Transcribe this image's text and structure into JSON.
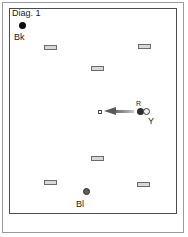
{
  "figure": {
    "caption": "Diag. 1",
    "width": 188,
    "height": 237,
    "background": "#ffffff",
    "frame_color": "#9a9a9a",
    "field_border_color": "#4c4c4c"
  },
  "tokens": [
    {
      "id": "bk",
      "label": "Bk",
      "meaning": "black",
      "color": "#0d0d0d",
      "shape": "circle",
      "x": 19,
      "y": 22,
      "diameter": 7,
      "label_x": 14,
      "label_y": 33
    },
    {
      "id": "r",
      "label": "R",
      "meaning": "red",
      "color": "#2e2e2e",
      "shape": "circle",
      "x": 137,
      "y": 108,
      "diameter": 7,
      "label_x": 136,
      "label_y": 100
    },
    {
      "id": "y",
      "label": "Y",
      "meaning": "yellow",
      "color": "#f2f2f2",
      "shape": "circle",
      "x": 143,
      "y": 108,
      "diameter": 7,
      "label_x": 147,
      "label_y": 117
    },
    {
      "id": "bl",
      "label": "Bl",
      "meaning": "blue",
      "color": "#5e5e5e",
      "shape": "circle",
      "x": 83,
      "y": 188,
      "diameter": 7,
      "label_x": 76,
      "label_y": 200
    }
  ],
  "markers": [
    {
      "id": "marker-top-left",
      "x": 44,
      "y": 45,
      "width": 13,
      "height": 5
    },
    {
      "id": "marker-top-right",
      "x": 138,
      "y": 44,
      "width": 13,
      "height": 5
    },
    {
      "id": "marker-upper-center",
      "x": 91,
      "y": 66,
      "width": 13,
      "height": 5
    },
    {
      "id": "marker-lower-center",
      "x": 91,
      "y": 156,
      "width": 13,
      "height": 5
    },
    {
      "id": "marker-bottom-left",
      "x": 44,
      "y": 180,
      "width": 13,
      "height": 5
    },
    {
      "id": "marker-bottom-right",
      "x": 137,
      "y": 182,
      "width": 13,
      "height": 5
    }
  ],
  "target": {
    "id": "target-point",
    "x": 98,
    "y": 110,
    "size": 4
  },
  "arrow": {
    "id": "motion-arrow",
    "direction": "left",
    "x": 104,
    "y": 107,
    "length": 30,
    "head_color": "#5a5a5a",
    "tail_color": "#9c9c9c"
  }
}
